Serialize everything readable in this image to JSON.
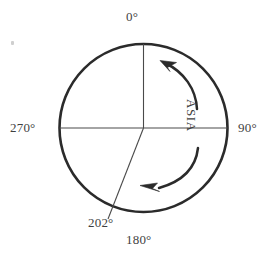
{
  "figure": {
    "title_text": "",
    "background_color": "#ffffff",
    "line_color": "#2b2b2b",
    "text_color": "#3f3f3f",
    "circle": {
      "center_x": 143.5,
      "center_y": 128,
      "radius": 84
    },
    "labels": {
      "north": "0°",
      "east": "90°",
      "south": "180°",
      "west": "270°",
      "bearing": "202°",
      "region": "ASIA"
    },
    "radii": [
      {
        "name": "north-radius",
        "bearing_degrees": 0
      },
      {
        "name": "east-radius",
        "bearing_degrees": 90
      },
      {
        "name": "west-radius",
        "bearing_degrees": 270
      },
      {
        "name": "bearing-radius",
        "bearing_degrees": 202
      }
    ],
    "arrows": [
      {
        "name": "upper-rotation-arrow",
        "direction": "counterclockwise",
        "points_to": "upper-left"
      },
      {
        "name": "lower-rotation-arrow",
        "direction": "counterclockwise",
        "points_to": "lower-left"
      }
    ]
  }
}
